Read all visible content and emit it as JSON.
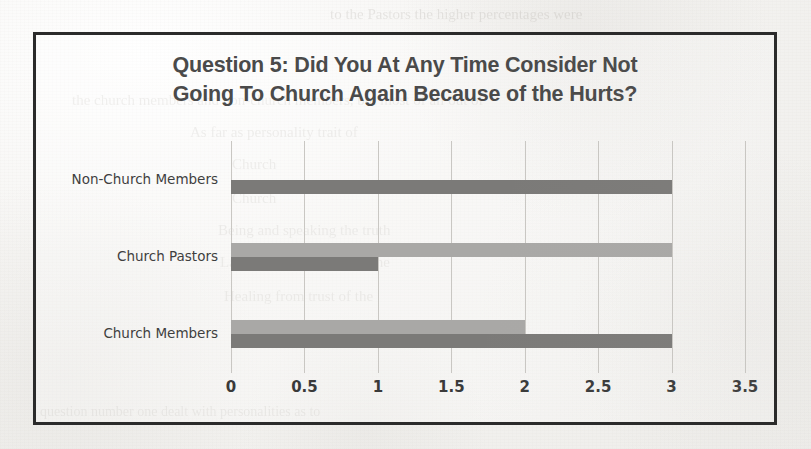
{
  "page": {
    "background_color": "#f2f1ef",
    "ghost_text": [
      {
        "text": "to the Pastors the higher percentages were",
        "x": 330,
        "y": 6,
        "size": 15
      },
      {
        "text": "the church members and non-church members, but most of all out of",
        "x": 72,
        "y": 92,
        "size": 15
      },
      {
        "text": "As far as personality trait of",
        "x": 190,
        "y": 124,
        "size": 15
      },
      {
        "text": "Church",
        "x": 232,
        "y": 156,
        "size": 15
      },
      {
        "text": "Church",
        "x": 232,
        "y": 190,
        "size": 15
      },
      {
        "text": "Being and speaking the truth",
        "x": 218,
        "y": 222,
        "size": 15
      },
      {
        "text": "Lack of responsibility of the",
        "x": 220,
        "y": 254,
        "size": 15
      },
      {
        "text": "Healing from trust of the",
        "x": 224,
        "y": 288,
        "size": 15
      },
      {
        "text": "question number one dealt with personalities as to",
        "x": 40,
        "y": 404,
        "size": 14
      }
    ]
  },
  "chart_frame": {
    "border_color": "#2b2b2b"
  },
  "chart_data": {
    "type": "bar",
    "orientation": "horizontal",
    "title": "Question 5: Did You At Any Time Consider Not Going To Church Again Because of the Hurts?",
    "title_lines": [
      "Question 5: Did You At Any Time Consider Not",
      "Going To Church Again Because of the Hurts?"
    ],
    "xlabel": "",
    "ylabel": "",
    "categories": [
      "Non-Church Members",
      "Church Pastors",
      "Church Members"
    ],
    "series": [
      {
        "name": "series-light",
        "color": "#a9a8a6",
        "values": [
          0,
          3,
          2
        ]
      },
      {
        "name": "series-dark",
        "color": "#7b7a78",
        "values": [
          3,
          1,
          3
        ]
      }
    ],
    "xlim": [
      0,
      3.5
    ],
    "xticks": [
      0,
      0.5,
      1,
      1.5,
      2,
      2.5,
      3,
      3.5
    ],
    "xtick_labels": [
      "0",
      "0.5",
      "1",
      "1.5",
      "2",
      "2.5",
      "3",
      "3.5"
    ],
    "grid": true,
    "grid_axis": "x",
    "grid_color": "#c9c7c3",
    "legend": false,
    "legend_position": "none"
  }
}
